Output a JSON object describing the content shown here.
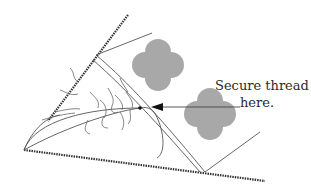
{
  "diagram": {
    "annotation": {
      "line1": "Secure thread",
      "line2": "here."
    },
    "colors": {
      "background": "#ffffff",
      "hatched_edge": "#333333",
      "line": "#555555",
      "clover_fill": "#a8a8a8",
      "arrow": "#111111",
      "text": "#2a2a2a"
    },
    "elements": [
      "upper-hatched-edge",
      "lower-hatched-edge",
      "curved-fold-lines",
      "squiggle-fibers",
      "clover-shape-upper",
      "clover-shape-lower",
      "arrow-pointer",
      "thread-dot"
    ]
  }
}
